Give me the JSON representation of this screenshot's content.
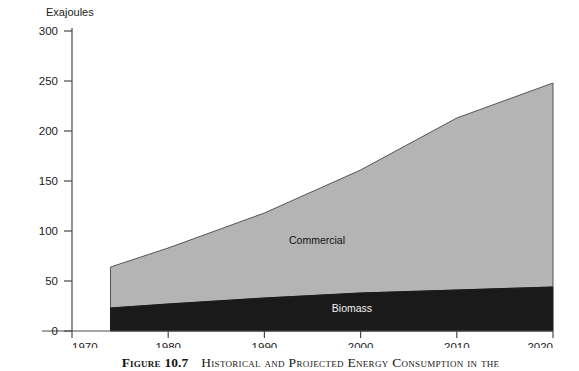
{
  "chart_data": {
    "type": "area",
    "title": "",
    "subtitle": "",
    "xlabel": "",
    "ylabel": "Exajoules",
    "ylabel_position": "top-left",
    "xlim": [
      1970,
      2020
    ],
    "ylim": [
      0,
      300
    ],
    "yticks": [
      0,
      50,
      100,
      150,
      200,
      250,
      300
    ],
    "xticks": [
      1970,
      1980,
      1990,
      2000,
      2010,
      2020
    ],
    "grid": false,
    "legend": "inline-labels",
    "stacked": true,
    "data_start_year": 1974,
    "x": [
      1974,
      1980,
      1990,
      2000,
      2010,
      2020
    ],
    "series": [
      {
        "name": "Biomass",
        "color": "#1a1a1a",
        "label_color": "#f2f2f2",
        "values": [
          23,
          27,
          33,
          38,
          41,
          44
        ]
      },
      {
        "name": "Commercial",
        "color": "#b4b4b4",
        "label_color": "#111111",
        "values": [
          41,
          56,
          85,
          123,
          172,
          204
        ]
      }
    ],
    "totals": [
      64,
      83,
      118,
      161,
      213,
      248
    ],
    "annotations": [
      {
        "text": "Commercial",
        "x": 2000,
        "y": 100
      },
      {
        "text": "Biomass",
        "x": 2000,
        "y": 26
      }
    ]
  },
  "axes": {
    "y_axis_title": "Exajoules",
    "y_tick_labels": [
      "300",
      "250",
      "200",
      "150",
      "100",
      "50",
      "0"
    ],
    "x_tick_labels": [
      "1970",
      "1980",
      "1990",
      "2000",
      "2010",
      "2020"
    ]
  },
  "series_labels": {
    "commercial": "Commercial",
    "biomass": "Biomass"
  },
  "caption": {
    "figure_word": "Figure",
    "number": "10.7",
    "text": "Historical and Projected Energy Consumption in the"
  }
}
